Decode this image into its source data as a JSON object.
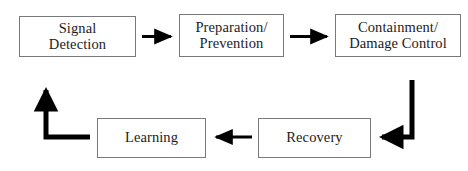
{
  "diagram": {
    "type": "flowchart-loop",
    "background_color": "#ffffff",
    "box_border_color": "#78797b",
    "text_color": "#1c1c1c",
    "arrow_color": "#000000",
    "nodes": [
      {
        "id": "signal-detection",
        "label": "Signal\nDetection"
      },
      {
        "id": "preparation-prevention",
        "label": "Preparation/\nPrevention"
      },
      {
        "id": "containment-damage-control",
        "label": "Containment/\nDamage Control"
      },
      {
        "id": "recovery",
        "label": "Recovery"
      },
      {
        "id": "learning",
        "label": "Learning"
      }
    ],
    "connectors": [
      {
        "id": "arrow-signal-to-preparation",
        "from": "signal-detection",
        "to": "preparation-prevention",
        "style": "straight",
        "direction": "right"
      },
      {
        "id": "arrow-preparation-to-containment",
        "from": "preparation-prevention",
        "to": "containment-damage-control",
        "style": "straight",
        "direction": "right"
      },
      {
        "id": "arrow-containment-to-recovery",
        "from": "containment-damage-control",
        "to": "recovery",
        "style": "elbow",
        "direction": "down-then-left"
      },
      {
        "id": "arrow-recovery-to-learning",
        "from": "recovery",
        "to": "learning",
        "style": "straight",
        "direction": "left"
      },
      {
        "id": "arrow-learning-to-signal",
        "from": "learning",
        "to": "signal-detection",
        "style": "elbow",
        "direction": "left-then-up"
      }
    ]
  }
}
